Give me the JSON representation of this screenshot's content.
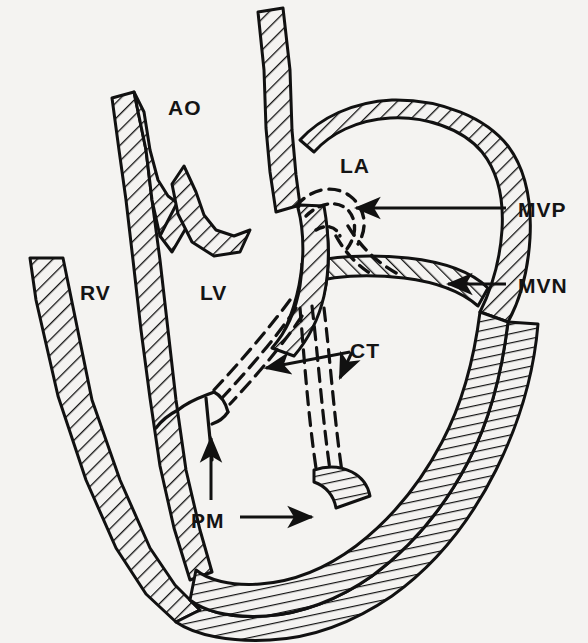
{
  "figure": {
    "kind": "anatomical-line-diagram",
    "style": "black ink line drawing with diagonal hatch-filled myocardial walls on off-white background",
    "background_color": "#f4f3f1",
    "ink_color": "#111111"
  },
  "labels": [
    {
      "id": "ao",
      "text": "AO",
      "name": "aorta",
      "x": 168,
      "y": 97,
      "leader": "none"
    },
    {
      "id": "la",
      "text": "LA",
      "name": "left-atrium",
      "x": 340,
      "y": 155,
      "leader": "none"
    },
    {
      "id": "rv",
      "text": "RV",
      "name": "right-ventricle",
      "x": 80,
      "y": 282,
      "leader": "none"
    },
    {
      "id": "lv",
      "text": "LV",
      "name": "left-ventricle",
      "x": 200,
      "y": 282,
      "leader": "none"
    },
    {
      "id": "mvp",
      "text": "MVP",
      "name": "mitral-valve-prolapse",
      "x": 518,
      "y": 199,
      "leader": "arrow-left"
    },
    {
      "id": "mvn",
      "text": "MVN",
      "name": "mitral-valve-normal",
      "x": 518,
      "y": 275,
      "leader": "arrow-left"
    },
    {
      "id": "ct",
      "text": "CT",
      "name": "chordae-tendineae",
      "x": 350,
      "y": 340,
      "leader": "double-arrow"
    },
    {
      "id": "pm",
      "text": "PM",
      "name": "papillary-muscle",
      "x": 191,
      "y": 510,
      "leader": "arrow-right"
    }
  ],
  "leaders": [
    {
      "id": "mvp-leader",
      "name": "mvp-leader-line",
      "from_label": "MVP",
      "points_to": "anterior mitral leaflet at the atrial side"
    },
    {
      "id": "mvn-leader",
      "name": "mvn-leader-line",
      "from_label": "MVN",
      "points_to": "posterior mitral leaflet coaptation"
    },
    {
      "id": "ct-leader",
      "name": "ct-leader-lines",
      "from_label": "CT",
      "points_to": "two bundles of chordae tendineae"
    },
    {
      "id": "pm-leader",
      "name": "pm-leader-line",
      "from_label": "PM",
      "points_to": "posterior papillary muscle on ventricular wall"
    },
    {
      "id": "pm-vertical",
      "name": "pm-vertical-arrow",
      "from_label": "PM",
      "points_to": "anterior papillary muscle"
    }
  ],
  "structures": [
    {
      "id": "rv-free-wall",
      "name": "right-ventricle-free-wall",
      "fill": "hatch"
    },
    {
      "id": "septum",
      "name": "interventricular-septum",
      "fill": "hatch"
    },
    {
      "id": "aortic-root",
      "name": "aortic-root-and-arch",
      "fill": "hatch"
    },
    {
      "id": "la-wall",
      "name": "left-atrium-wall",
      "fill": "hatch"
    },
    {
      "id": "lv-free-wall",
      "name": "left-ventricle-free-wall",
      "fill": "hatch"
    },
    {
      "id": "anterior-leaflet",
      "name": "anterior-mitral-leaflet",
      "fill": "dashed-outline"
    },
    {
      "id": "posterior-leaflet",
      "name": "posterior-mitral-leaflet",
      "fill": "hatch"
    },
    {
      "id": "chordae-a",
      "name": "chordae-bundle-anterior",
      "fill": "dashed-lines"
    },
    {
      "id": "chordae-p",
      "name": "chordae-bundle-posterior",
      "fill": "dashed-lines"
    },
    {
      "id": "papillary-ant",
      "name": "anterior-papillary-muscle",
      "fill": "outline"
    },
    {
      "id": "papillary-post",
      "name": "posterior-papillary-muscle",
      "fill": "hatch"
    }
  ]
}
